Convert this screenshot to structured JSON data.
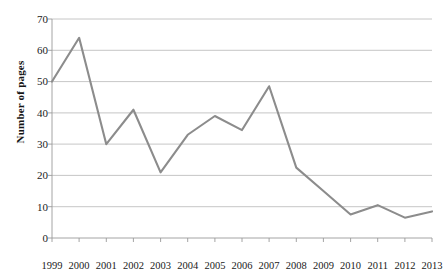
{
  "chart_data": {
    "type": "line",
    "title": "",
    "xlabel": "",
    "ylabel": "Number of pages",
    "categories": [
      "1999",
      "2000",
      "2001",
      "2002",
      "2003",
      "2004",
      "2005",
      "2006",
      "2007",
      "2008",
      "2009",
      "2010",
      "2011",
      "2012",
      "2013"
    ],
    "values": [
      50,
      64,
      30,
      41,
      21,
      33,
      39,
      34.5,
      48.5,
      22.5,
      15,
      7.5,
      10.5,
      6.5,
      8.5
    ],
    "series": [
      {
        "name": "Number of pages",
        "values": [
          50,
          64,
          30,
          41,
          21,
          33,
          39,
          34.5,
          48.5,
          22.5,
          15,
          7.5,
          10.5,
          6.5,
          8.5
        ]
      }
    ],
    "ylim": [
      0,
      70
    ],
    "yticks": [
      0,
      10,
      20,
      30,
      40,
      50,
      60,
      70
    ],
    "ytick_labels": [
      "0",
      "10",
      "20",
      "30",
      "40",
      "50",
      "60",
      "70"
    ],
    "xtick_labels": [
      "1999",
      "2000",
      "2001",
      "2002",
      "2003",
      "2004",
      "2005",
      "2006",
      "2007",
      "2008",
      "2009",
      "2010",
      "2011",
      "2012",
      "2013"
    ],
    "grid": "horizontal",
    "legend": "none",
    "line_color": "#8c8c8c",
    "grid_color": "#b8b8b8",
    "axis_color": "#9a9a9a",
    "background": "#ffffff"
  }
}
